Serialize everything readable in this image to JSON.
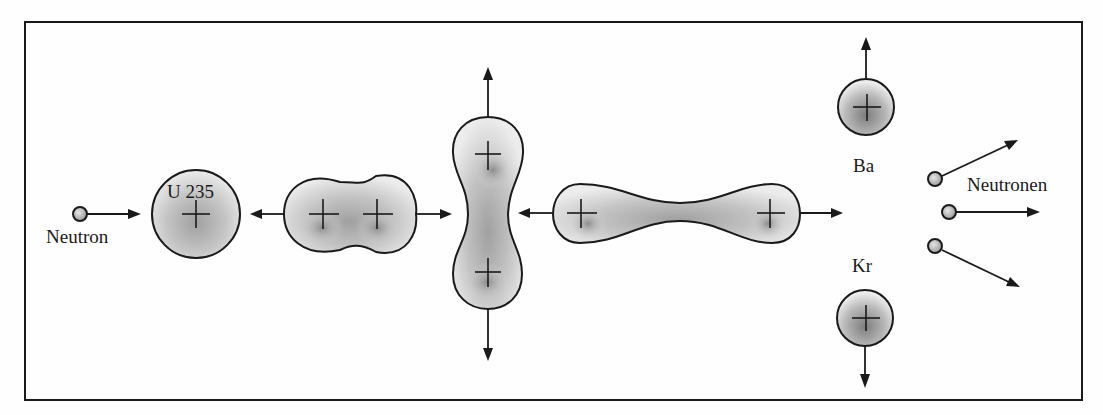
{
  "diagram": {
    "frame": {
      "x": 25,
      "y": 22,
      "width": 1057,
      "height": 378,
      "color": "#1a1a1a"
    },
    "labels": {
      "neutron": "Neutron",
      "uranium": "U 235",
      "barium": "Ba",
      "krypton": "Kr",
      "neutrons_out": "Neutronen"
    },
    "stages": [
      {
        "id": "incoming-neutron",
        "description": "Einfallendes Neutron"
      },
      {
        "id": "u235-nucleus",
        "description": "Uran-235-Kern"
      },
      {
        "id": "deformed-nucleus",
        "description": "Deformierter Kern (Einschnürung)"
      },
      {
        "id": "elongated-vertical",
        "description": "Stark gestreckter Kern"
      },
      {
        "id": "elongated-horizontal",
        "description": "Kern kurz vor der Spaltung"
      },
      {
        "id": "fission-fragments",
        "description": "Spaltprodukte Ba und Kr"
      },
      {
        "id": "released-neutrons",
        "description": "Freigesetzte Neutronen (3)"
      }
    ],
    "colors": {
      "nucleus_fill_light": "#e8e8e8",
      "nucleus_fill_dark": "#9a9a9a",
      "outline": "#1a1a1a",
      "background": "#fefefe"
    }
  }
}
